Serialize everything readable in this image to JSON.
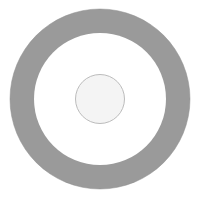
{
  "figure": {
    "title": "Concentric ring diagram",
    "canvas": {
      "width": 201,
      "height": 199,
      "background_color": "#ffffff"
    },
    "shapes": {
      "annulus": {
        "name": "outer ring",
        "center_x": 100,
        "center_y": 99,
        "outer_radius": 90,
        "inner_radius": 66,
        "band_thickness": 24,
        "fill_color": "#9a9a9a",
        "stroke_color": "#8f8f8f",
        "stroke_width": 0.5
      },
      "inner_gap": {
        "name": "white annular gap",
        "center_x": 100,
        "center_y": 99,
        "radius": 66,
        "fill_color": "#ffffff"
      },
      "center_disc": {
        "name": "center circle",
        "center_x": 100,
        "center_y": 99,
        "radius": 24.5,
        "fill_color": "#f4f4f4",
        "stroke_color": "#bcbcbc",
        "stroke_width": 1
      }
    }
  }
}
